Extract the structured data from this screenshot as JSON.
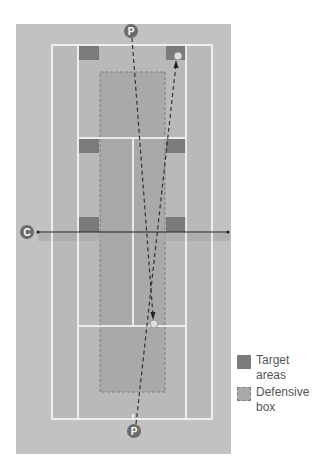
{
  "diagram": {
    "colors": {
      "background": "#ffffff",
      "outer_area": "#c2c2c2",
      "court": "#b9b9b9",
      "lines": "#ffffff",
      "target_area": "#7b7b7b",
      "defensive_box": "#a9a9a9",
      "net_shadow": "#aaaaaa",
      "marker": "#6b6b6b",
      "marker_text": "#ffffff",
      "path": "#333333",
      "ball": "#dcdcdc"
    },
    "markers": [
      {
        "id": "player-top",
        "label": "P",
        "x": 131,
        "y": 31
      },
      {
        "id": "coach",
        "label": "C",
        "x": 27,
        "y": 232
      },
      {
        "id": "player-bottom",
        "label": "P",
        "x": 134,
        "y": 431
      }
    ],
    "balls": [
      {
        "id": "ball-top",
        "x": 178,
        "y": 56
      },
      {
        "id": "ball-bottom",
        "x": 154,
        "y": 324
      }
    ]
  },
  "legend": {
    "items": [
      {
        "label": "Target areas",
        "type": "target"
      },
      {
        "label": "Defensive box",
        "type": "defensive"
      }
    ]
  }
}
